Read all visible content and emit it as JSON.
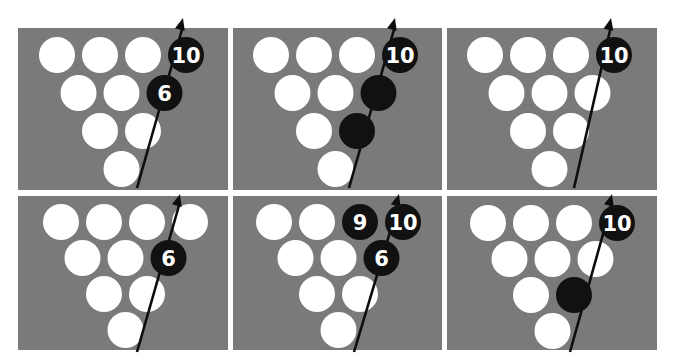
{
  "figure": {
    "title": "",
    "background": "#ffffff",
    "panel_color": "#7a7a7a",
    "standing_pin_color": "#ffffff",
    "highlighted_pin_color": "#111111",
    "path_color": "#0d0d0d"
  },
  "panels": [
    {
      "id": "top-left",
      "highlighted_pins": [
        {
          "pin": 10,
          "label": "10"
        },
        {
          "pin": 6,
          "label": "6"
        }
      ],
      "arrow": {
        "from": [
          137,
          188
        ],
        "to": [
          183,
          18
        ]
      }
    },
    {
      "id": "top-middle",
      "highlighted_pins": [
        {
          "pin": 10,
          "label": "10"
        },
        {
          "pin": 6,
          "label": ""
        },
        {
          "pin": 3,
          "label": ""
        }
      ],
      "arrow": {
        "from": [
          349,
          188
        ],
        "to": [
          395,
          18
        ]
      }
    },
    {
      "id": "top-right",
      "highlighted_pins": [
        {
          "pin": 10,
          "label": "10"
        }
      ],
      "arrow": {
        "from": [
          574,
          188
        ],
        "to": [
          611,
          18
        ]
      }
    },
    {
      "id": "bottom-left",
      "highlighted_pins": [
        {
          "pin": 6,
          "label": "6"
        }
      ],
      "arrow": {
        "from": [
          137,
          352
        ],
        "to": [
          180,
          194
        ]
      }
    },
    {
      "id": "bottom-middle",
      "highlighted_pins": [
        {
          "pin": 9,
          "label": "9"
        },
        {
          "pin": 10,
          "label": "10"
        },
        {
          "pin": 6,
          "label": "6"
        }
      ],
      "arrow": {
        "from": [
          354,
          352
        ],
        "to": [
          399,
          194
        ]
      }
    },
    {
      "id": "bottom-right",
      "highlighted_pins": [
        {
          "pin": 10,
          "label": "10"
        },
        {
          "pin": 3,
          "label": ""
        }
      ],
      "arrow": {
        "from": [
          570,
          352
        ],
        "to": [
          612,
          194
        ]
      }
    }
  ]
}
